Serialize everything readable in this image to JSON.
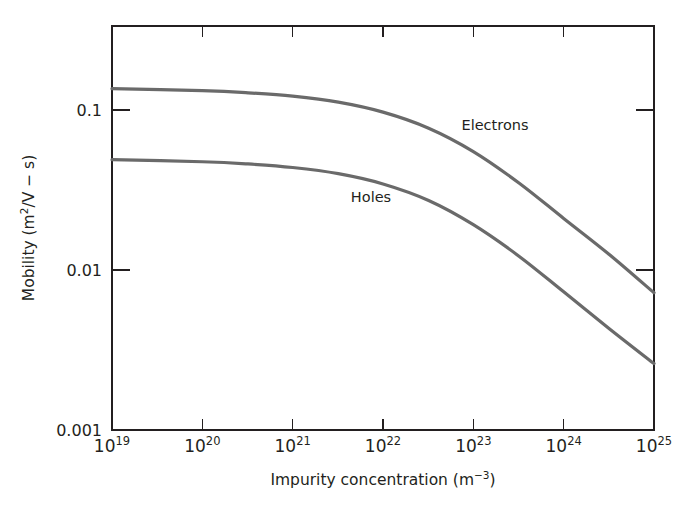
{
  "chart_data": {
    "type": "line",
    "title": "",
    "xlabel": "Impurity concentration (m−3)",
    "ylabel": "Mobility (m2/V − s)",
    "xscale": "log",
    "yscale": "log",
    "xlim": [
      1e+19,
      1e+25
    ],
    "ylim": [
      0.001,
      0.3
    ],
    "grid": false,
    "legend_position": "inline-annotations",
    "x_tick_labels": [
      "10¹⁹",
      "10²⁰",
      "10²¹",
      "10²²",
      "10²³",
      "10²⁴",
      "10²⁵"
    ],
    "x_tick_values": [
      1e+19,
      1e+20,
      1e+21,
      1e+22,
      1e+23,
      1e+24,
      1e+25
    ],
    "y_tick_labels": [
      "0.1",
      "0.01",
      "0.001"
    ],
    "y_tick_values": [
      0.1,
      0.01,
      0.001
    ],
    "series": [
      {
        "name": "Electrons",
        "color": "#6a6a6a",
        "x": [
          1e+19,
          1e+20,
          3.2e+20,
          1e+21,
          3.2e+21,
          1e+22,
          3.2e+22,
          1e+23,
          3.2e+23,
          1e+24,
          3.2e+24,
          1e+25
        ],
        "values": [
          0.136,
          0.132,
          0.128,
          0.122,
          0.112,
          0.097,
          0.077,
          0.055,
          0.035,
          0.021,
          0.0125,
          0.0072
        ]
      },
      {
        "name": "Holes",
        "color": "#6a6a6a",
        "x": [
          1e+19,
          1e+20,
          3.2e+20,
          1e+21,
          3.2e+21,
          1e+22,
          3.2e+22,
          1e+23,
          3.2e+23,
          1e+24,
          3.2e+24,
          1e+25
        ],
        "values": [
          0.0489,
          0.0475,
          0.046,
          0.0437,
          0.04,
          0.0345,
          0.0272,
          0.0192,
          0.0122,
          0.0073,
          0.0043,
          0.0026
        ]
      }
    ],
    "annotations": [
      {
        "text": "Electrons",
        "x": 4.3e+23,
        "y": 0.072
      },
      {
        "text": "Holes",
        "x": 1.1e+22,
        "y": 0.0255
      }
    ]
  },
  "axes": {
    "x_title": "Impurity concentration (m",
    "x_title_exp": "−3",
    "x_title_close": ")",
    "y_title_a": "Mobility (m",
    "y_title_exp": "2",
    "y_title_b": "/V − s)"
  },
  "x_ticks": [
    {
      "base": "10",
      "exp": "19"
    },
    {
      "base": "10",
      "exp": "20"
    },
    {
      "base": "10",
      "exp": "21"
    },
    {
      "base": "10",
      "exp": "22"
    },
    {
      "base": "10",
      "exp": "23"
    },
    {
      "base": "10",
      "exp": "24"
    },
    {
      "base": "10",
      "exp": "25"
    }
  ],
  "y_ticks": [
    {
      "label": "0.1"
    },
    {
      "label": "0.01"
    },
    {
      "label": "0.001"
    }
  ],
  "annotations": [
    {
      "label": "Electrons"
    },
    {
      "label": "Holes"
    }
  ],
  "colors": {
    "curve": "#6a6a6a",
    "axis": "#231f20",
    "background": "#ffffff"
  }
}
